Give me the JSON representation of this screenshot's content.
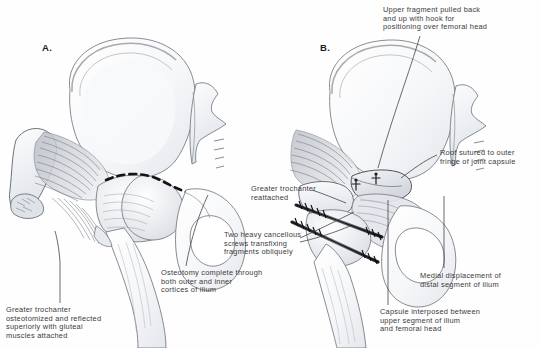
{
  "figure": {
    "kind": "medical-surgical-illustration",
    "technique": "pen-and-ink with graphite shading",
    "background_color": "#fefefe",
    "ink_color": "#3a3a3c",
    "shade_color": "#c9ccd2"
  },
  "panels": [
    {
      "id": "A",
      "label": "A.",
      "x": 42,
      "y": 42,
      "description": "Exposure stage: greater trochanter osteotomized and reflected, osteotomy line marked across ilium"
    },
    {
      "id": "B",
      "label": "B.",
      "x": 320,
      "y": 42,
      "description": "Fixation stage: upper fragment displaced and transfixed with two cancellous screws, trochanter reattached"
    }
  ],
  "captions": [
    {
      "id": "upper-fragment",
      "panel": "B",
      "text": "Upper fragment pulled back\nand up with hook for\npositioning over femoral head",
      "x": 383,
      "y": 6,
      "align": "left",
      "leader": [
        [
          420,
          36
        ],
        [
          398,
          72
        ],
        [
          378,
          168
        ]
      ]
    },
    {
      "id": "roof-sutured",
      "panel": "B",
      "text": "Roof sutured to outer\nfringe of joint capsule",
      "x": 440,
      "y": 149,
      "align": "left",
      "leader": [
        [
          437,
          155
        ],
        [
          420,
          163
        ],
        [
          401,
          178
        ]
      ]
    },
    {
      "id": "greater-trochanter-reattached",
      "panel": "B",
      "text": "Greater trochanter\nreattached",
      "x": 251,
      "y": 185,
      "align": "left",
      "leader": [
        [
          312,
          190
        ],
        [
          330,
          196
        ],
        [
          344,
          202
        ]
      ]
    },
    {
      "id": "two-screws",
      "panel": "B",
      "text": "Two heavy cancellous\nscrews transfixing\nfragments obliquely",
      "x": 224,
      "y": 231,
      "align": "left",
      "leader": [
        [
          300,
          238
        ],
        [
          330,
          224
        ],
        [
          352,
          213
        ]
      ]
    },
    {
      "id": "medial-displacement",
      "panel": "B",
      "text": "Medial displacement of\ndistal segment of ilium",
      "x": 420,
      "y": 272,
      "align": "left",
      "leader": [
        [
          444,
          268
        ],
        [
          444,
          240
        ],
        [
          444,
          196
        ]
      ]
    },
    {
      "id": "capsule-interposed",
      "panel": "B",
      "text": "Capsule interposed between\nupper segment of ilium\nand femoral head",
      "x": 380,
      "y": 308,
      "align": "left",
      "leader": [
        [
          388,
          305
        ],
        [
          388,
          270
        ],
        [
          388,
          200
        ]
      ]
    },
    {
      "id": "osteotomy-complete",
      "panel": "A",
      "text": "Osteotomy complete through\nboth outer and inner\ncortices of ilium",
      "x": 161,
      "y": 269,
      "align": "left",
      "leader": [
        [
          186,
          266
        ],
        [
          195,
          232
        ],
        [
          208,
          196
        ]
      ]
    },
    {
      "id": "greater-trochanter-osteotomized",
      "panel": "A",
      "text": "Greater trochanter\nosteotomized and reflected\nsuperiorly with gluteal\nmuscles attached",
      "x": 6,
      "y": 306,
      "align": "left",
      "leader": [
        [
          60,
          303
        ],
        [
          60,
          262
        ],
        [
          56,
          232
        ]
      ]
    }
  ],
  "anatomy_features": [
    {
      "name": "iliac-wing",
      "panel": "A"
    },
    {
      "name": "sacrum",
      "panel": "A"
    },
    {
      "name": "sacral-foramina",
      "panel": "A"
    },
    {
      "name": "reflected-greater-trochanter",
      "panel": "A"
    },
    {
      "name": "gluteal-muscle-fibers",
      "panel": "A"
    },
    {
      "name": "dashed-osteotomy-line",
      "panel": "A"
    },
    {
      "name": "femoral-head-and-neck",
      "panel": "A"
    },
    {
      "name": "femoral-shaft",
      "panel": "A"
    },
    {
      "name": "obturator-foramen",
      "panel": "A"
    },
    {
      "name": "ischium-pubis",
      "panel": "A"
    },
    {
      "name": "iliac-wing",
      "panel": "B"
    },
    {
      "name": "sacrum",
      "panel": "B"
    },
    {
      "name": "displaced-upper-fragment",
      "panel": "B"
    },
    {
      "name": "joint-capsule",
      "panel": "B"
    },
    {
      "name": "suture-stitches",
      "panel": "B"
    },
    {
      "name": "cancellous-screw-superior",
      "panel": "B"
    },
    {
      "name": "cancellous-screw-inferior",
      "panel": "B"
    },
    {
      "name": "femoral-shaft",
      "panel": "B"
    },
    {
      "name": "obturator-foramen",
      "panel": "B"
    },
    {
      "name": "ischium-pubis",
      "panel": "B"
    }
  ]
}
